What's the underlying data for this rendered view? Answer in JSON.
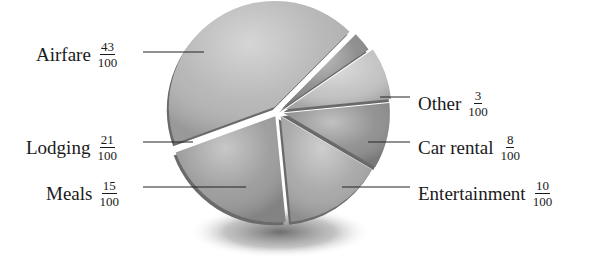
{
  "chart_data": {
    "type": "pie",
    "title": "",
    "style": "3d exploded pie, grayscale",
    "categories": [
      "Airfare",
      "Other",
      "Car rental",
      "Entertainment",
      "Meals",
      "Lodging"
    ],
    "values": [
      43,
      3,
      8,
      10,
      15,
      21
    ],
    "fractions": [
      "43/100",
      "3/100",
      "8/100",
      "10/100",
      "15/100",
      "21/100"
    ],
    "total": 100,
    "colors": [
      "#b4b4b4",
      "#8a8a8a",
      "#c2c2c2",
      "#8e8e8e",
      "#a6a6a6",
      "#9a9a9a"
    ],
    "legend_position": "leader-line labels around pie"
  },
  "labels": [
    {
      "name": "Airfare",
      "num": "43",
      "den": "100"
    },
    {
      "name": "Other",
      "num": "3",
      "den": "100"
    },
    {
      "name": "Car rental",
      "num": "8",
      "den": "100"
    },
    {
      "name": "Entertainment",
      "num": "10",
      "den": "100"
    },
    {
      "name": "Meals",
      "num": "15",
      "den": "100"
    },
    {
      "name": "Lodging",
      "num": "21",
      "den": "100"
    }
  ]
}
